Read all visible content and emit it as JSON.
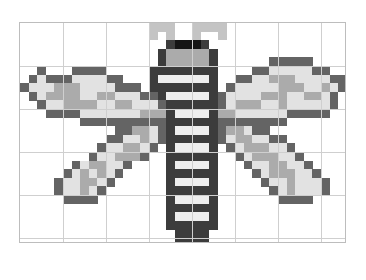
{
  "canvas": {
    "title": "",
    "cols": 38,
    "rows": 26,
    "cell_size": 8.6,
    "major_every": 5,
    "grid_color": "#cfcfcf",
    "border_color": "#bdbdbd",
    "background": "#ffffff"
  },
  "palette": {
    ".": null,
    "A": "#c4c4c4",
    "K": "#141414",
    "H": "#3c3c3c",
    "B": "#3a3a3a",
    "D": "#646464",
    "M": "#ababab",
    "L": "#e2e2e2",
    "W": "#eeeeee",
    "G": "#888888"
  },
  "sprite": {
    "name": "dragonfly",
    "rows": [
      "...............AAA..AAAA..............",
      "...............A.A..A..A..............",
      ".................HKKKH................",
      "................HMMMMMH...............",
      "................HMMMMMH......DDDDD....",
      "..D...DDDD.....HHHHHHHH....DDLLLLLDD..",
      ".DLDDDLLLLDD...HWWWWWWH..DDLLMMMLLLLDD",
      "DLLLMMMLLLLDDD.HHHHHHHH.DLLLLLMMMLLMLD",
      ".DLMMMMLLMMLLLDDHWWWWWHDLLLLMMMLLMMLD.",
      "..DLLMMMMLLMMLLLDHHHHHHDLMMMLLMLLLLLD.",
      "...DDDDLLLLLLLMMMHWWWWHMMLLLLLLDDDDD..",
      ".......DDDDDDDDDDHHHHHHDDDDDDDD.......",
      "...........DDMMLDHWWWWHDMMLDD.........",
      "..........DDLLMLDHHHHHHDLMMLLDD.......",
      ".........DLLMMLD.HWWWWH.DLMMMLLD......",
      "........DLLMMMD..HHHHHH..DLMMMLLD.....",
      "......DLMMLLD....HWWWWH...DLLMMLLD....",
      ".....DLMLMLD.....HHHHHH....DLMMMLLD...",
      "....DLLMMLD......HWWWWH.....DLLMLLLD..",
      "....DLLMLD.......HHHHHH......DLMLLLD..",
      ".....DDDD........HWWWWH.......DDDD....",
      ".................HHHHHH...............",
      ".................HWWWWH...............",
      ".................HHHHHH...............",
      "..................HHHH................",
      "..................HHHH................"
    ]
  }
}
